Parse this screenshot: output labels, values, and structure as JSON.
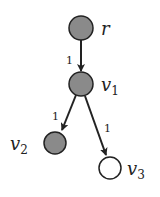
{
  "diagram": {
    "type": "tree",
    "colors": {
      "filled_node": "#8a8a8a",
      "empty_node": "#ffffff",
      "stroke": "#222222",
      "background": "#ffffff"
    },
    "nodes": [
      {
        "id": "r",
        "label": "r",
        "subscript": "",
        "filled": true,
        "cx": 81,
        "cy": 28
      },
      {
        "id": "v1",
        "label": "v",
        "subscript": "1",
        "filled": true,
        "cx": 81,
        "cy": 84
      },
      {
        "id": "v2",
        "label": "v",
        "subscript": "2",
        "filled": true,
        "cx": 55,
        "cy": 143
      },
      {
        "id": "v3",
        "label": "v",
        "subscript": "3",
        "filled": false,
        "cx": 110,
        "cy": 168
      }
    ],
    "edges": [
      {
        "from": "r",
        "to": "v1",
        "weight": "1"
      },
      {
        "from": "v1",
        "to": "v2",
        "weight": "1"
      },
      {
        "from": "v1",
        "to": "v3",
        "weight": "1"
      }
    ]
  }
}
